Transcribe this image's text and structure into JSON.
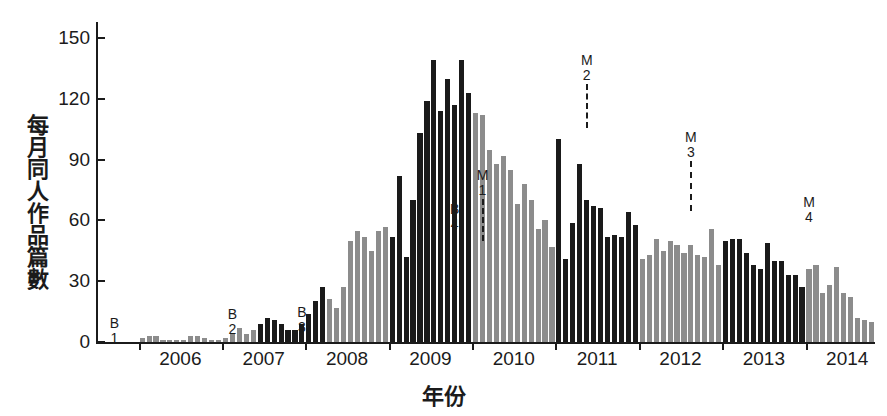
{
  "chart_data": {
    "type": "bar",
    "title": "",
    "xlabel": "年份",
    "ylabel": "每月同人作品篇數",
    "ylim": [
      0,
      158
    ],
    "yticks": [
      0,
      30,
      60,
      90,
      120,
      150
    ],
    "ytick_labels": [
      "0",
      "30",
      "60",
      "90",
      "120",
      "150"
    ],
    "xticks": [
      2006,
      2007,
      2008,
      2009,
      2010,
      2011,
      2012,
      2013,
      2014
    ],
    "xtick_labels": [
      "2006",
      "2007",
      "2008",
      "2009",
      "2010",
      "2011",
      "2012",
      "2013",
      "2014"
    ],
    "grid": false,
    "legend": "none",
    "x_start": "2005-07",
    "x_end": "2014-10",
    "colors": {
      "dark": "#1a1a1a",
      "gray": "#8c8c8c",
      "axis": "#1b1b1b",
      "background": "#ffffff"
    },
    "categories": [
      "2005-07",
      "2005-08",
      "2005-09",
      "2005-10",
      "2005-11",
      "2005-12",
      "2006-01",
      "2006-02",
      "2006-03",
      "2006-04",
      "2006-05",
      "2006-06",
      "2006-07",
      "2006-08",
      "2006-09",
      "2006-10",
      "2006-11",
      "2006-12",
      "2007-01",
      "2007-02",
      "2007-03",
      "2007-04",
      "2007-05",
      "2007-06",
      "2007-07",
      "2007-08",
      "2007-09",
      "2007-10",
      "2007-11",
      "2007-12",
      "2008-01",
      "2008-02",
      "2008-03",
      "2008-04",
      "2008-05",
      "2008-06",
      "2008-07",
      "2008-08",
      "2008-09",
      "2008-10",
      "2008-11",
      "2008-12",
      "2009-01",
      "2009-02",
      "2009-03",
      "2009-04",
      "2009-05",
      "2009-06",
      "2009-07",
      "2009-08",
      "2009-09",
      "2009-10",
      "2009-11",
      "2009-12",
      "2010-01",
      "2010-02",
      "2010-03",
      "2010-04",
      "2010-05",
      "2010-06",
      "2010-07",
      "2010-08",
      "2010-09",
      "2010-10",
      "2010-11",
      "2010-12",
      "2011-01",
      "2011-02",
      "2011-03",
      "2011-04",
      "2011-05",
      "2011-06",
      "2011-07",
      "2011-08",
      "2011-09",
      "2011-10",
      "2011-11",
      "2011-12",
      "2012-01",
      "2012-02",
      "2012-03",
      "2012-04",
      "2012-05",
      "2012-06",
      "2012-07",
      "2012-08",
      "2012-09",
      "2012-10",
      "2012-11",
      "2012-12",
      "2013-01",
      "2013-02",
      "2013-03",
      "2013-04",
      "2013-05",
      "2013-06",
      "2013-07",
      "2013-08",
      "2013-09",
      "2013-10",
      "2013-11",
      "2013-12",
      "2014-01",
      "2014-02",
      "2014-03",
      "2014-04",
      "2014-05",
      "2014-06",
      "2014-07",
      "2014-08",
      "2014-09",
      "2014-10"
    ],
    "values": [
      0,
      0,
      0,
      0,
      0,
      0,
      2,
      3,
      3,
      1,
      1,
      1,
      1,
      3,
      3,
      2,
      1,
      1,
      2,
      4,
      7,
      4,
      6,
      9,
      12,
      11,
      9,
      6,
      6,
      9,
      14,
      20,
      27,
      21,
      17,
      27,
      50,
      55,
      52,
      45,
      55,
      57,
      52,
      82,
      42,
      70,
      103,
      119,
      139,
      114,
      130,
      117,
      139,
      123,
      113,
      112,
      95,
      88,
      92,
      85,
      68,
      78,
      70,
      56,
      60,
      47,
      100,
      41,
      59,
      88,
      70,
      67,
      66,
      52,
      53,
      52,
      64,
      58,
      41,
      43,
      51,
      45,
      50,
      48,
      44,
      48,
      43,
      42,
      56,
      38,
      50,
      51,
      51,
      44,
      38,
      36,
      49,
      40,
      40,
      33,
      33,
      27,
      36,
      38,
      24,
      28,
      37,
      24,
      22,
      12,
      11,
      10
    ],
    "colors_by_bar": [
      "gray",
      "gray",
      "gray",
      "gray",
      "gray",
      "gray",
      "gray",
      "gray",
      "gray",
      "gray",
      "gray",
      "gray",
      "gray",
      "gray",
      "gray",
      "gray",
      "gray",
      "gray",
      "gray",
      "gray",
      "gray",
      "gray",
      "gray",
      "dark",
      "dark",
      "dark",
      "dark",
      "dark",
      "dark",
      "dark",
      "dark",
      "dark",
      "dark",
      "gray",
      "gray",
      "gray",
      "gray",
      "gray",
      "gray",
      "gray",
      "gray",
      "gray",
      "dark",
      "dark",
      "dark",
      "dark",
      "dark",
      "dark",
      "dark",
      "dark",
      "dark",
      "dark",
      "dark",
      "dark",
      "gray",
      "gray",
      "gray",
      "gray",
      "gray",
      "gray",
      "gray",
      "gray",
      "gray",
      "gray",
      "gray",
      "gray",
      "dark",
      "dark",
      "dark",
      "dark",
      "dark",
      "dark",
      "dark",
      "dark",
      "dark",
      "dark",
      "dark",
      "dark",
      "gray",
      "gray",
      "gray",
      "gray",
      "gray",
      "gray",
      "gray",
      "gray",
      "gray",
      "gray",
      "gray",
      "gray",
      "dark",
      "dark",
      "dark",
      "dark",
      "dark",
      "dark",
      "dark",
      "dark",
      "dark",
      "dark",
      "dark",
      "dark",
      "gray",
      "gray",
      "gray",
      "gray",
      "gray",
      "gray",
      "gray",
      "gray",
      "gray",
      "gray"
    ],
    "annotations": [
      {
        "id": "B1",
        "letter": "B",
        "num": "1",
        "x_index": 2,
        "label_y": 316,
        "dash_height": 0
      },
      {
        "id": "B2",
        "letter": "B",
        "num": "2",
        "x_index": 19,
        "label_y": 307,
        "dash_height": 0
      },
      {
        "id": "B3",
        "letter": "B",
        "num": "3",
        "x_index": 29,
        "label_y": 305,
        "dash_height": 0
      },
      {
        "id": "B4",
        "letter": "B",
        "num": "4",
        "x_index": 51,
        "label_y": 202,
        "dash_height": 0
      },
      {
        "id": "M1",
        "letter": "M",
        "num": "1",
        "x_index": 55,
        "label_y": 168,
        "dash_height": 42
      },
      {
        "id": "M2",
        "letter": "M",
        "num": "2",
        "x_index": 70,
        "label_y": 53,
        "dash_height": 44
      },
      {
        "id": "M3",
        "letter": "M",
        "num": "3",
        "x_index": 85,
        "label_y": 130,
        "dash_height": 50
      },
      {
        "id": "M4",
        "letter": "M",
        "num": "4",
        "x_index": 102,
        "label_y": 195,
        "dash_height": 0
      },
      {
        "id": "M5",
        "letter": "M",
        "num": "5",
        "x_index": 119,
        "label_y": 208,
        "dash_height": 0
      }
    ]
  }
}
